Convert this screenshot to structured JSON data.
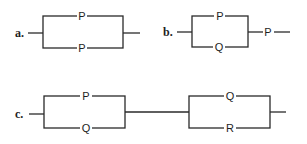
{
  "circuits": [
    {
      "id": "a",
      "label": "a.",
      "type": "parallel",
      "branches": [
        {
          "position": "top",
          "switch": "P"
        },
        {
          "position": "bottom",
          "switch": "P"
        }
      ],
      "series_after": null
    },
    {
      "id": "b",
      "label": "b.",
      "type": "parallel-then-series",
      "branches": [
        {
          "position": "top",
          "switch": "P"
        },
        {
          "position": "bottom",
          "switch": "Q"
        }
      ],
      "series_after": "P"
    },
    {
      "id": "c",
      "label": "c.",
      "type": "two-parallel-blocks-in-series",
      "blocks": [
        {
          "branches": [
            {
              "position": "top",
              "switch": "P"
            },
            {
              "position": "bottom",
              "switch": "Q"
            }
          ]
        },
        {
          "branches": [
            {
              "position": "top",
              "switch": "Q"
            },
            {
              "position": "bottom",
              "switch": "R"
            }
          ]
        }
      ]
    }
  ]
}
